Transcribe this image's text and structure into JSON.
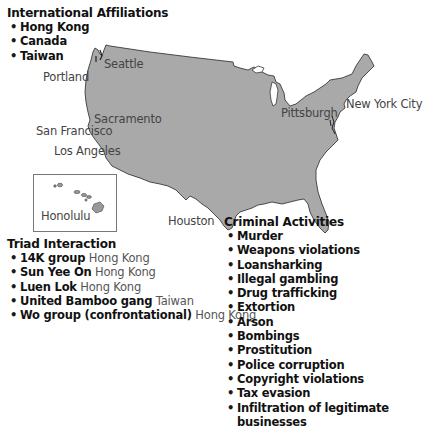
{
  "colors": {
    "land_fill": "#a9a9a9",
    "land_stroke": "#3a3a3a",
    "text_main": "#111111",
    "text_city": "#444444"
  },
  "international_affiliations": {
    "title": "International Affiliations",
    "items": [
      "Hong Kong",
      "Canada",
      "Taiwan"
    ]
  },
  "cities": {
    "seattle": "Seattle",
    "portland": "Portland",
    "sacramento": "Sacramento",
    "san_francisco": "San Francisco",
    "los_angeles": "Los Angeles",
    "honolulu": "Honolulu",
    "houston": "Houston",
    "pittsburgh": "Pittsburgh",
    "new_york_city": "New York City"
  },
  "triad_interaction": {
    "title": "Triad Interaction",
    "items": [
      {
        "group": "14K group",
        "location": "Hong Kong"
      },
      {
        "group": "Sun Yee On",
        "location": "Hong Kong"
      },
      {
        "group": "Luen Lok",
        "location": "Hong Kong"
      },
      {
        "group": "United Bamboo gang",
        "location": "Taiwan"
      },
      {
        "group": "Wo group (confrontational)",
        "location": "Hong Kong"
      }
    ]
  },
  "criminal_activities": {
    "title": "Criminal Activities",
    "items": [
      "Murder",
      "Weapons violations",
      "Loansharking",
      "Illegal gambling",
      "Drug trafficking",
      "Extortion",
      "Arson",
      "Bombings",
      "Prostitution",
      "Police corruption",
      "Copyright violations",
      "Tax evasion",
      "Infiltration of legitimate",
      "businesses"
    ]
  },
  "bullet_glyph": "•"
}
